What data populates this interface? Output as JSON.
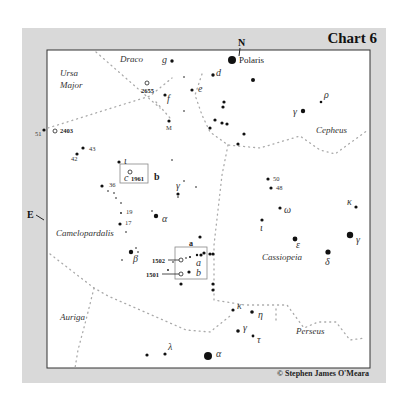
{
  "chart_title": "Chart 6",
  "credit": "© Stephen James O'Meara",
  "directions": {
    "north": "N",
    "east": "E"
  },
  "constellations": [
    {
      "name": "Draco",
      "x": 120,
      "y": 62
    },
    {
      "name": "Ursa",
      "x": 60,
      "y": 76
    },
    {
      "name": "Major",
      "x": 60,
      "y": 88
    },
    {
      "name": "Cepheus",
      "x": 316,
      "y": 133
    },
    {
      "name": "Camelopardalis",
      "x": 56,
      "y": 236
    },
    {
      "name": "Cassiopeia",
      "x": 262,
      "y": 260
    },
    {
      "name": "Auriga",
      "x": 60,
      "y": 320
    },
    {
      "name": "Perseus",
      "x": 296,
      "y": 334
    }
  ],
  "stars": [
    {
      "label": "Polaris",
      "x": 232,
      "y": 60,
      "r": 4,
      "lx": 239,
      "ly": 63,
      "style": "lbl",
      "size": 9
    },
    {
      "label": "g",
      "x": 172,
      "y": 61,
      "r": 1.7,
      "lx": 162,
      "ly": 63,
      "style": "greek"
    },
    {
      "label": "d",
      "x": 213,
      "y": 75,
      "r": 1.7,
      "lx": 216,
      "ly": 76,
      "style": "greek"
    },
    {
      "label": "",
      "x": 253,
      "y": 80,
      "r": 2,
      "lx": 0,
      "ly": 0
    },
    {
      "label": "e",
      "x": 192,
      "y": 90,
      "r": 1.6,
      "lx": 198,
      "ly": 92,
      "style": "greek"
    },
    {
      "label": "f",
      "x": 165,
      "y": 95,
      "r": 1.6,
      "lx": 167,
      "ly": 102,
      "style": "greek"
    },
    {
      "label": "",
      "x": 184,
      "y": 77,
      "r": 0.8,
      "lx": 0,
      "ly": 0
    },
    {
      "label": "",
      "x": 184,
      "y": 111,
      "r": 0.8,
      "lx": 0,
      "ly": 0
    },
    {
      "label": "M",
      "x": 169,
      "y": 121,
      "r": 1.6,
      "lx": 166,
      "ly": 130,
      "style": "num"
    },
    {
      "label": "",
      "x": 224,
      "y": 102,
      "r": 1.6,
      "lx": 0,
      "ly": 0
    },
    {
      "label": "",
      "x": 223,
      "y": 107,
      "r": 1.6,
      "lx": 0,
      "ly": 0
    },
    {
      "label": "",
      "x": 215,
      "y": 120,
      "r": 1.6,
      "lx": 0,
      "ly": 0
    },
    {
      "label": "",
      "x": 222,
      "y": 123,
      "r": 1.6,
      "lx": 0,
      "ly": 0
    },
    {
      "label": "",
      "x": 227,
      "y": 124,
      "r": 1.6,
      "lx": 0,
      "ly": 0
    },
    {
      "label": "",
      "x": 210,
      "y": 128,
      "r": 1.6,
      "lx": 0,
      "ly": 0
    },
    {
      "label": "",
      "x": 244,
      "y": 134,
      "r": 1.6,
      "lx": 0,
      "ly": 0
    },
    {
      "label": "",
      "x": 238,
      "y": 144,
      "r": 1.6,
      "lx": 0,
      "ly": 0
    },
    {
      "label": "γ",
      "x": 303,
      "y": 111,
      "r": 2.2,
      "lx": 293,
      "ly": 115,
      "style": "greek"
    },
    {
      "label": "ρ",
      "x": 321,
      "y": 102,
      "r": 1.3,
      "lx": 324,
      "ly": 98,
      "style": "greek"
    },
    {
      "label": "51",
      "x": 44,
      "y": 130,
      "r": 1.6,
      "lx": 35,
      "ly": 136,
      "style": "num"
    },
    {
      "label": "43",
      "x": 83,
      "y": 148,
      "r": 1.6,
      "lx": 89,
      "ly": 151,
      "style": "num"
    },
    {
      "label": "42",
      "x": 77,
      "y": 154,
      "r": 1.6,
      "lx": 71,
      "ly": 161,
      "style": "num"
    },
    {
      "label": "ι",
      "x": 119,
      "y": 162,
      "r": 1.6,
      "lx": 124,
      "ly": 164,
      "style": "greek"
    },
    {
      "label": "",
      "x": 172,
      "y": 160,
      "r": 0.8,
      "lx": 0,
      "ly": 0
    },
    {
      "label": "36",
      "x": 102,
      "y": 186,
      "r": 1.6,
      "lx": 109,
      "ly": 187,
      "style": "num"
    },
    {
      "label": "",
      "x": 108,
      "y": 191,
      "r": 0.8,
      "lx": 0,
      "ly": 0
    },
    {
      "label": "",
      "x": 114,
      "y": 193,
      "r": 0.8,
      "lx": 0,
      "ly": 0
    },
    {
      "label": "",
      "x": 116,
      "y": 198,
      "r": 0.8,
      "lx": 0,
      "ly": 0
    },
    {
      "label": "",
      "x": 121,
      "y": 203,
      "r": 0.8,
      "lx": 0,
      "ly": 0
    },
    {
      "label": "19",
      "x": 121,
      "y": 213,
      "r": 0.9,
      "lx": 126,
      "ly": 214,
      "style": "num"
    },
    {
      "label": "17",
      "x": 120,
      "y": 224,
      "r": 1.6,
      "lx": 125,
      "ly": 225,
      "style": "num"
    },
    {
      "label": "",
      "x": 126,
      "y": 232,
      "r": 0.8,
      "lx": 0,
      "ly": 0
    },
    {
      "label": "α",
      "x": 156,
      "y": 216,
      "r": 2.2,
      "lx": 162,
      "ly": 222,
      "style": "greek"
    },
    {
      "label": "",
      "x": 152,
      "y": 211,
      "r": 0.8,
      "lx": 0,
      "ly": 0
    },
    {
      "label": "",
      "x": 184,
      "y": 181,
      "r": 0.8,
      "lx": 0,
      "ly": 0
    },
    {
      "label": "",
      "x": 196,
      "y": 187,
      "r": 0.8,
      "lx": 0,
      "ly": 0
    },
    {
      "label": "γ",
      "x": 178,
      "y": 194,
      "r": 1.6,
      "lx": 176,
      "ly": 189,
      "style": "greek"
    },
    {
      "label": "",
      "x": 178,
      "y": 197,
      "r": 0.8,
      "lx": 0,
      "ly": 0
    },
    {
      "label": "β",
      "x": 131,
      "y": 252,
      "r": 2.2,
      "lx": 133,
      "ly": 262,
      "style": "greek"
    },
    {
      "label": "",
      "x": 136,
      "y": 248,
      "r": 0.8,
      "lx": 0,
      "ly": 0
    },
    {
      "label": "",
      "x": 138,
      "y": 252,
      "r": 0.8,
      "lx": 0,
      "ly": 0
    },
    {
      "label": "",
      "x": 122,
      "y": 260,
      "r": 0.8,
      "lx": 0,
      "ly": 0
    },
    {
      "label": "",
      "x": 200,
      "y": 237,
      "r": 1.6,
      "lx": 0,
      "ly": 0
    },
    {
      "label": "",
      "x": 204,
      "y": 253,
      "r": 1.6,
      "lx": 0,
      "ly": 0
    },
    {
      "label": "",
      "x": 201,
      "y": 255,
      "r": 1.6,
      "lx": 0,
      "ly": 0
    },
    {
      "label": "",
      "x": 197,
      "y": 255,
      "r": 1.2,
      "lx": 0,
      "ly": 0
    },
    {
      "label": "",
      "x": 190,
      "y": 257,
      "r": 1,
      "lx": 0,
      "ly": 0
    },
    {
      "label": "",
      "x": 186,
      "y": 258,
      "r": 0.8,
      "lx": 0,
      "ly": 0
    },
    {
      "label": "",
      "x": 210,
      "y": 254,
      "r": 1.6,
      "lx": 0,
      "ly": 0
    },
    {
      "label": "a",
      "x": 213,
      "y": 254,
      "r": 1.6,
      "lx": 196,
      "ly": 266,
      "style": "greek"
    },
    {
      "label": "b",
      "x": 189,
      "y": 272,
      "r": 1.6,
      "lx": 196,
      "ly": 276,
      "style": "greek"
    },
    {
      "label": "",
      "x": 168,
      "y": 270,
      "r": 0.9,
      "lx": 0,
      "ly": 0
    },
    {
      "label": "",
      "x": 173,
      "y": 262,
      "r": 0.8,
      "lx": 0,
      "ly": 0
    },
    {
      "label": "",
      "x": 181,
      "y": 284,
      "r": 1.6,
      "lx": 0,
      "ly": 0
    },
    {
      "label": "",
      "x": 213,
      "y": 284,
      "r": 1.6,
      "lx": 0,
      "ly": 0
    },
    {
      "label": "",
      "x": 213,
      "y": 290,
      "r": 1.6,
      "lx": 0,
      "ly": 0
    },
    {
      "label": "50",
      "x": 268,
      "y": 179,
      "r": 1.6,
      "lx": 273,
      "ly": 181,
      "style": "num"
    },
    {
      "label": "48",
      "x": 271,
      "y": 188,
      "r": 1.6,
      "lx": 276,
      "ly": 190,
      "style": "num"
    },
    {
      "label": "ω",
      "x": 280,
      "y": 208,
      "r": 1.6,
      "lx": 284,
      "ly": 213,
      "style": "greek"
    },
    {
      "label": "ι",
      "x": 262,
      "y": 220,
      "r": 1.6,
      "lx": 260,
      "ly": 231,
      "style": "greek"
    },
    {
      "label": "ε",
      "x": 295,
      "y": 239,
      "r": 2.4,
      "lx": 296,
      "ly": 248,
      "style": "greek"
    },
    {
      "label": "δ",
      "x": 328,
      "y": 252,
      "r": 2.6,
      "lx": 325,
      "ly": 265,
      "style": "greek"
    },
    {
      "label": "γ",
      "x": 350,
      "y": 235,
      "r": 3.2,
      "lx": 356,
      "ly": 243,
      "style": "greek"
    },
    {
      "label": "κ",
      "x": 356,
      "y": 207,
      "r": 1.6,
      "lx": 347,
      "ly": 205,
      "style": "greek"
    },
    {
      "label": "κ",
      "x": 233,
      "y": 310,
      "r": 1.6,
      "lx": 237,
      "ly": 309,
      "style": "greek"
    },
    {
      "label": "η",
      "x": 252,
      "y": 312,
      "r": 1.8,
      "lx": 258,
      "ly": 318,
      "style": "greek"
    },
    {
      "label": "γ",
      "x": 238,
      "y": 331,
      "r": 1.8,
      "lx": 243,
      "ly": 331,
      "style": "greek"
    },
    {
      "label": "τ",
      "x": 253,
      "y": 336,
      "r": 1.4,
      "lx": 257,
      "ly": 343,
      "style": "greek"
    },
    {
      "label": "α",
      "x": 208,
      "y": 356,
      "r": 4,
      "lx": 216,
      "ly": 357,
      "style": "greek"
    },
    {
      "label": "λ",
      "x": 165,
      "y": 354,
      "r": 1.6,
      "lx": 168,
      "ly": 350,
      "style": "greek"
    },
    {
      "label": "",
      "x": 147,
      "y": 355,
      "r": 1.6,
      "lx": 0,
      "ly": 0
    }
  ],
  "deep_sky": [
    {
      "label": "2655",
      "x": 147,
      "y": 83,
      "lx": 141,
      "ly": 93
    },
    {
      "label": "2403",
      "x": 55,
      "y": 131,
      "lx": 60,
      "ly": 133
    },
    {
      "label": "1961",
      "x": 130,
      "y": 172,
      "lx": 131,
      "ly": 181
    },
    {
      "label": "1502",
      "x": 181,
      "y": 260,
      "lx": 152,
      "ly": 263
    },
    {
      "label": "1501",
      "x": 181,
      "y": 274,
      "lx": 146,
      "ly": 277
    }
  ],
  "insets": [
    {
      "id": "a",
      "label": "a",
      "x": 175,
      "y": 247,
      "w": 32,
      "h": 32,
      "lx": 189,
      "ly": 246
    },
    {
      "id": "b",
      "label": "b",
      "x": 120,
      "y": 164,
      "w": 28,
      "h": 19,
      "lx": 154,
      "ly": 180
    }
  ],
  "misc_labels": [
    {
      "label": "c",
      "x": 124,
      "y": 181,
      "style": "greek"
    }
  ]
}
